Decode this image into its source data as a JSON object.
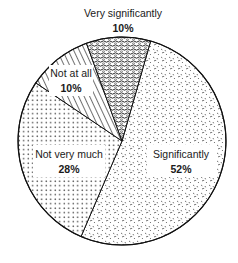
{
  "chart_data": {
    "type": "pie",
    "title": "",
    "start": "clockwise",
    "slices": [
      {
        "label": "Significantly",
        "value": 52,
        "display": "52%",
        "pattern": "fine-dash-stipple"
      },
      {
        "label": "Not very much",
        "value": 28,
        "display": "28%",
        "pattern": "dots"
      },
      {
        "label": "Not at all",
        "value": 10,
        "display": "10%",
        "pattern": "diagonal-hatch"
      },
      {
        "label": "Very significantly",
        "value": 10,
        "display": "10%",
        "pattern": "dense-wavy"
      }
    ],
    "legend": "none",
    "label_placement": "inside/above slices"
  }
}
